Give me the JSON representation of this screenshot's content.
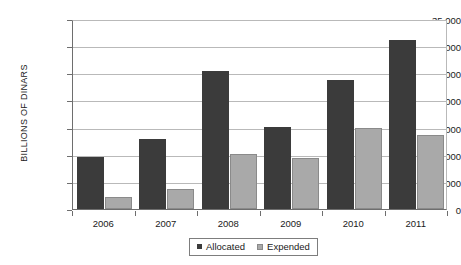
{
  "chart_data": {
    "type": "bar",
    "title": "",
    "subtitle": "",
    "xlabel": "",
    "ylabel": "BILLIONS OF DINARS",
    "categories": [
      "2006",
      "2007",
      "2008",
      "2009",
      "2010",
      "2011"
    ],
    "series": [
      {
        "name": "Allocated",
        "color": "#3b3b3b",
        "values": [
          9500,
          12900,
          25400,
          15100,
          23800,
          31200
        ]
      },
      {
        "name": "Expended",
        "color": "#a9a9a9",
        "values": [
          2200,
          3700,
          10200,
          9400,
          14900,
          13600
        ]
      }
    ],
    "ylim": [
      0,
      35000
    ],
    "ytick_values": [
      0,
      5000,
      10000,
      15000,
      20000,
      25000,
      30000,
      35000
    ],
    "ytick_labels": [
      "0",
      "5,000",
      "10,000",
      "15,000",
      "20,000",
      "25,000",
      "30,000",
      "35,000"
    ],
    "grid": true,
    "grid_axis": "y",
    "legend_position": "bottom-center",
    "legend_entries": [
      "Allocated",
      "Expended"
    ],
    "annotations": []
  },
  "colors": {
    "allocated": "#3b3b3b",
    "expended": "#a9a9a9",
    "gridline": "#b9b9b9",
    "axis": "#6e6e6e",
    "background": "#ffffff",
    "text": "#1a1a1a"
  }
}
